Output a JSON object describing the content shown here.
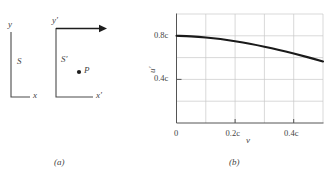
{
  "figure": {
    "panel_a": {
      "caption": "(a)",
      "frame_s": {
        "name_label": "S",
        "y_axis_label": "y",
        "x_axis_label": "x"
      },
      "frame_s_prime": {
        "name_label": "S′",
        "y_axis_label": "y′",
        "x_axis_label": "x′",
        "velocity_arrow": "velocity-arrow",
        "point_label": "P"
      }
    },
    "panel_b": {
      "caption": "(b)",
      "colors": {
        "curve": "#1a1a1a",
        "grid": "#c9c9c9",
        "axis": "#555555",
        "text": "#3f3f3f"
      }
    }
  },
  "chart_data": {
    "type": "line",
    "title": "",
    "xlabel": "v",
    "ylabel": "u′",
    "xticks": [
      0,
      0.2,
      0.4
    ],
    "xticklabels": [
      "0",
      "0.2c",
      "0.4c"
    ],
    "yticks": [
      0.4,
      0.8
    ],
    "yticklabels": [
      "0.4c",
      "0.8c"
    ],
    "xlim": [
      0,
      0.5
    ],
    "ylim": [
      0,
      1.0
    ],
    "grid": true,
    "legend": "none",
    "x": [
      0.0,
      0.05,
      0.1,
      0.15,
      0.2,
      0.25,
      0.3,
      0.35,
      0.4,
      0.45,
      0.5
    ],
    "values": [
      0.8,
      0.795,
      0.785,
      0.77,
      0.75,
      0.727,
      0.7,
      0.67,
      0.637,
      0.602,
      0.565
    ]
  }
}
